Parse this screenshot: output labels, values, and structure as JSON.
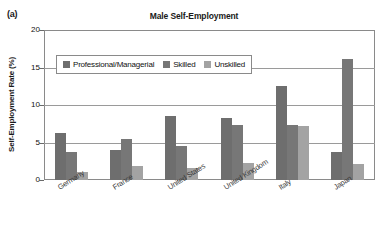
{
  "panel": {
    "label": "(a)"
  },
  "chart_data": {
    "type": "bar",
    "title": "Male Self-Employment",
    "xlabel": "",
    "ylabel": "Self-Employment Rate (%)",
    "ylim": [
      0,
      20
    ],
    "yticks": [
      "0",
      "5",
      "10",
      "15",
      "20"
    ],
    "ytick_values": [
      0,
      5,
      10,
      15,
      20
    ],
    "grid": true,
    "legend_position": "top-left-inside",
    "categories": [
      "Germany",
      "France",
      "United States",
      "United Kingdom",
      "Italy",
      "Japan"
    ],
    "series": [
      {
        "name": "Professional/Managerial",
        "color": "#6e6e6e",
        "values": [
          6.3,
          4.0,
          8.6,
          8.3,
          12.5,
          3.8
        ]
      },
      {
        "name": "Skilled",
        "color": "#777777",
        "values": [
          3.7,
          5.5,
          4.6,
          7.4,
          7.3,
          16.2
        ]
      },
      {
        "name": "Unskilled",
        "color": "#a3a3a3",
        "values": [
          1.1,
          1.9,
          1.6,
          2.3,
          7.2,
          2.1
        ]
      }
    ]
  }
}
